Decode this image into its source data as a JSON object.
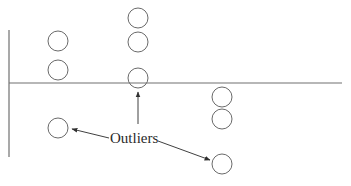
{
  "diagram": {
    "label": "Outliers",
    "colors": {
      "axis": "#707070",
      "points": "#6a6a6a",
      "arrows": "#404040",
      "text": "#2a2a2a"
    },
    "axes": {
      "vertical": {
        "x": 9,
        "y1": 30,
        "y2": 157
      },
      "horizontal": {
        "y": 83,
        "x1": 9,
        "x2": 342
      }
    },
    "points": [
      {
        "group": 1,
        "cx": 58,
        "cy": 41,
        "outlier": false
      },
      {
        "group": 1,
        "cx": 58,
        "cy": 70,
        "outlier": false
      },
      {
        "group": 1,
        "cx": 58,
        "cy": 128,
        "outlier": true
      },
      {
        "group": 2,
        "cx": 138,
        "cy": 18,
        "outlier": false
      },
      {
        "group": 2,
        "cx": 138,
        "cy": 42,
        "outlier": false
      },
      {
        "group": 2,
        "cx": 138,
        "cy": 78,
        "outlier": true
      },
      {
        "group": 3,
        "cx": 222,
        "cy": 97,
        "outlier": false
      },
      {
        "group": 3,
        "cx": 222,
        "cy": 119,
        "outlier": false
      },
      {
        "group": 3,
        "cx": 222,
        "cy": 164,
        "outlier": true
      }
    ],
    "arrows": [
      {
        "from": [
          109,
          138
        ],
        "to": [
          72,
          129
        ],
        "target": "outlier-group-1"
      },
      {
        "from": [
          138,
          124
        ],
        "to": [
          138,
          92
        ],
        "target": "outlier-group-2"
      },
      {
        "from": [
          158,
          141
        ],
        "to": [
          210,
          160
        ],
        "target": "outlier-group-3"
      }
    ]
  }
}
